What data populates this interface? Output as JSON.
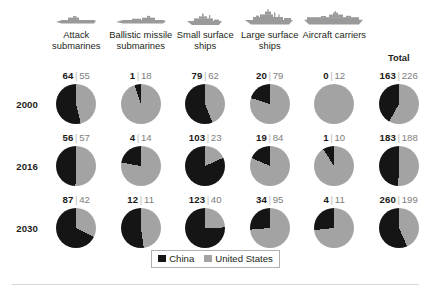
{
  "legend": {
    "items": [
      {
        "label": "China",
        "color": "#151515",
        "icon": "legend-swatch"
      },
      {
        "label": "United States",
        "color": "#a3a3a3",
        "icon": "legend-swatch"
      }
    ]
  },
  "colors": {
    "china": "#151515",
    "united_states": "#a3a3a3",
    "text": "#231f20",
    "us_text": "#7d7d7d",
    "separator": "#b9b9b9",
    "icon": "#9a9a9a",
    "rule": "#d7d7d7"
  },
  "chart_data": {
    "type": "pie",
    "title": "",
    "series": [
      {
        "name": "China",
        "color": "#151515"
      },
      {
        "name": "United States",
        "color": "#a3a3a3"
      }
    ],
    "categories": [
      "Attack submarines",
      "Ballistic missile submarines",
      "Small surface ships",
      "Large surface ships",
      "Aircraft carriers",
      "Total"
    ],
    "category_icons": [
      "submarine-icon",
      "submarine-icon",
      "small-surface-ship-icon",
      "large-surface-ship-icon",
      "aircraft-carrier-icon",
      ""
    ],
    "rows": [
      "2000",
      "2016",
      "2030"
    ],
    "direction": "counter-clockwise from 12 o'clock",
    "cells": [
      [
        {
          "china": 64,
          "us": 55
        },
        {
          "china": 1,
          "us": 18
        },
        {
          "china": 79,
          "us": 62
        },
        {
          "china": 20,
          "us": 79
        },
        {
          "china": 0,
          "us": 12
        },
        {
          "china": 163,
          "us": 226
        }
      ],
      [
        {
          "china": 56,
          "us": 57
        },
        {
          "china": 4,
          "us": 14
        },
        {
          "china": 103,
          "us": 23
        },
        {
          "china": 19,
          "us": 84
        },
        {
          "china": 1,
          "us": 10
        },
        {
          "china": 183,
          "us": 188
        }
      ],
      [
        {
          "china": 87,
          "us": 42
        },
        {
          "china": 12,
          "us": 11
        },
        {
          "china": 123,
          "us": 40
        },
        {
          "china": 34,
          "us": 95
        },
        {
          "china": 4,
          "us": 11
        },
        {
          "china": 260,
          "us": 199
        }
      ]
    ],
    "legend_position": "bottom-center",
    "grid": false
  }
}
